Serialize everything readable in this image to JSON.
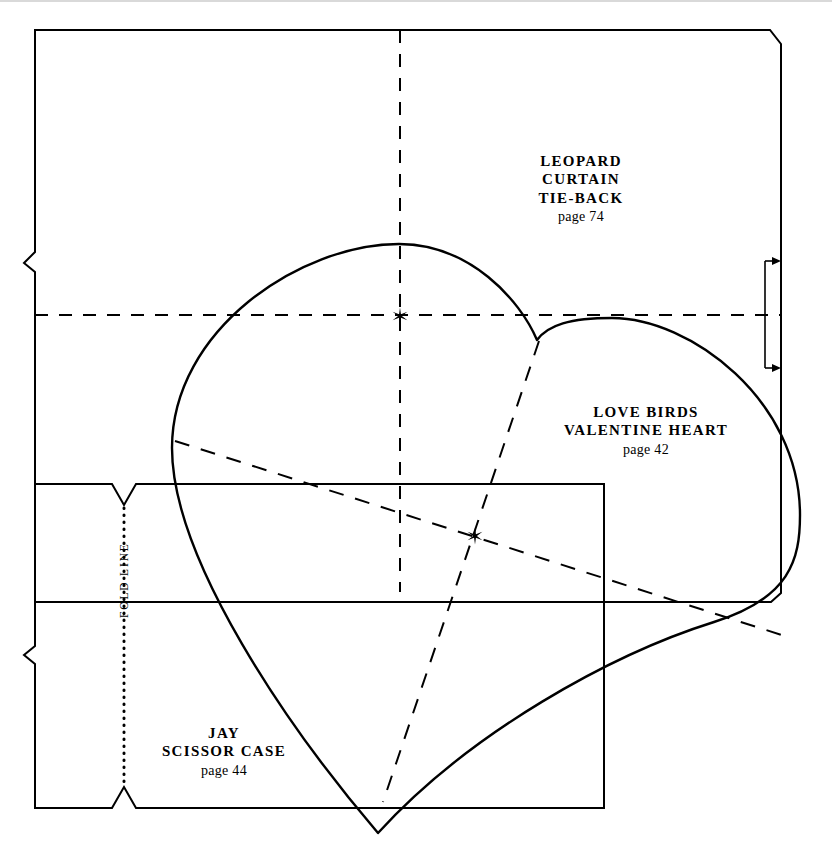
{
  "page": {
    "background_color": "#ffffff",
    "ink_color": "#000000",
    "width": 832,
    "height": 845
  },
  "labels": {
    "leopard": {
      "line1": "LEOPARD",
      "line2": "CURTAIN",
      "line3": "TIE-BACK",
      "page": "page 74"
    },
    "lovebirds": {
      "line1": "LOVE BIRDS",
      "line2": "VALENTINE HEART",
      "page": "page 42"
    },
    "jay": {
      "line1": "JAY",
      "line2": "SCISSOR CASE",
      "page": "page 44"
    },
    "fold_line": "FOLD LINE"
  },
  "shapes": {
    "leopard_curtain_tie_back": {
      "name": "leopard-curtain-tieback-outline",
      "stroke": "#000000",
      "stroke_width": 2,
      "fill": "none",
      "path": "M 35 30 L 770 30 L 781 44 L 781 593 L 771 602 L 35 602 L 35 272 L 24 263 L 35 252 L 35 30 Z"
    },
    "jay_scissor_case": {
      "name": "jay-scissor-case-outline",
      "stroke": "#000000",
      "stroke_width": 2,
      "fill": "none",
      "path": "M 35 484 L 112 484 L 124 505 L 136 484 L 604 484 L 604 808 L 136 808 L 124 787 L 112 808 L 35 808 L 35 664 L 24 655 L 35 646 L 35 484 Z"
    },
    "valentine_heart": {
      "name": "valentine-heart-outline",
      "stroke": "#000000",
      "stroke_width": 2.4,
      "fill": "none",
      "path": "M 537 340 C 520 300 470 244 399 244 C 300 244 172 330 172 448 C 172 560 290 730 378 833 C 470 732 612 654 714 622 C 790 598 800 560 800 515 C 800 400 690 318 612 318 C 570 318 548 325 537 340 Z"
    }
  },
  "guides": {
    "vertical_center_dashed": {
      "name": "vertical-center-guide",
      "style": "dashed",
      "x1": 400,
      "y1": 30,
      "x2": 400,
      "y2": 592
    },
    "horizontal_center_dashed": {
      "name": "horizontal-center-guide",
      "style": "dashed",
      "x1": 35,
      "y1": 315,
      "x2": 781,
      "y2": 315
    },
    "diagonal_long_dashed": {
      "name": "diagonal-guide-long",
      "style": "dashed",
      "x1": 175,
      "y1": 441,
      "x2": 791,
      "y2": 638
    },
    "diagonal_short_dashed": {
      "name": "diagonal-guide-short",
      "style": "dashed",
      "x1": 539,
      "y1": 341,
      "x2": 383,
      "y2": 802
    },
    "fold_line_dotted": {
      "name": "fold-line-guide",
      "style": "dotted",
      "x1": 124,
      "y1": 508,
      "x2": 124,
      "y2": 786
    }
  },
  "markers": {
    "center_star_top": {
      "name": "center-mark-leopard",
      "x": 400,
      "y": 316
    },
    "center_star_lower": {
      "name": "center-mark-jay",
      "x": 475,
      "y": 536
    }
  },
  "dimension_bracket": {
    "name": "seam-allowance-bracket",
    "x_line": 765,
    "x_tip": 781,
    "y_top": 261,
    "y_bottom": 368
  }
}
